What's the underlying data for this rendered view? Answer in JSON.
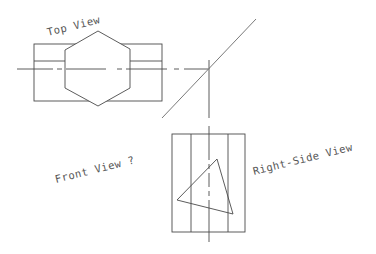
{
  "drawing": {
    "labels": {
      "top_view": "Top View",
      "front_view": "Front View ?",
      "right_side_view": "Right-Side View"
    },
    "colors": {
      "line": "#4a4a4a",
      "miter": "#6a6a6a",
      "text": "#555555",
      "background": "#ffffff"
    }
  }
}
